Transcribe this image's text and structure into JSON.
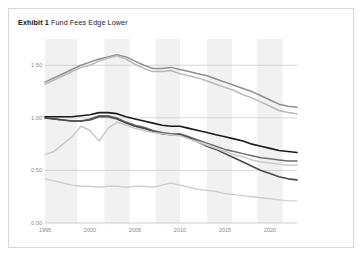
{
  "header": {
    "exhibit_label": "Exhibit 1",
    "title": "Fund Fees Edge Lower"
  },
  "legend": {
    "items": [
      {
        "label": "All (Asset Wt)",
        "color": "#4a4a4a",
        "badge": "①"
      },
      {
        "label": "All (Equal Wt)",
        "color": "#b9b9b9",
        "badge": ""
      },
      {
        "label": "Active (Asset Wt)",
        "color": "#1a1a1a",
        "badge": "②"
      },
      {
        "label": "Passive (Asset Wt)",
        "color": "#c9c9c9",
        "badge": "③"
      },
      {
        "label": "Active (Equal Wt)",
        "color": "#8f8f8f",
        "badge": ""
      },
      {
        "label": "Passive (Equal Wt)",
        "color": "#6f6f6f",
        "badge": ""
      }
    ]
  },
  "callouts": [
    {
      "badge": "②",
      "series": "Active (Asset Wt)"
    },
    {
      "badge": "①",
      "series": "All (Asset Wt)"
    },
    {
      "badge": "③",
      "series": "Passive (Asset Wt)"
    }
  ],
  "chart_data": {
    "type": "line",
    "title": "Fund Fees Edge Lower",
    "xlabel": "",
    "ylabel": "Average Fund Fee",
    "yunit": "%",
    "ylim": [
      0.0,
      1.75
    ],
    "xlim": [
      1995,
      2023
    ],
    "yticks": [
      0.0,
      0.5,
      1.0,
      1.5
    ],
    "ytick_labels": [
      "0.00",
      "0.50",
      "1.00",
      "1.50"
    ],
    "xticks": [
      1995,
      2000,
      2005,
      2010,
      2015,
      2020
    ],
    "xtick_labels": [
      "1995",
      "2000",
      "2005",
      "2010",
      "2015",
      "2020"
    ],
    "grid": "horizontal",
    "legend_position": "right",
    "shaded_bands": [
      {
        "from": 1995.0,
        "to": 1998.6
      },
      {
        "from": 2001.6,
        "to": 2004.4
      },
      {
        "from": 2007.3,
        "to": 2010.0
      },
      {
        "from": 2013.0,
        "to": 2015.8
      },
      {
        "from": 2018.6,
        "to": 2021.4
      }
    ],
    "x": [
      1995,
      1996,
      1997,
      1998,
      1999,
      2000,
      2001,
      2002,
      2003,
      2004,
      2005,
      2006,
      2007,
      2008,
      2009,
      2010,
      2011,
      2012,
      2013,
      2014,
      2015,
      2016,
      2017,
      2018,
      2019,
      2020,
      2021,
      2022,
      2023
    ],
    "series": [
      {
        "name": "Active (Equal Wt)",
        "color": "#8f8f8f",
        "width": 1.5,
        "values": [
          1.34,
          1.38,
          1.42,
          1.46,
          1.5,
          1.53,
          1.56,
          1.58,
          1.6,
          1.58,
          1.54,
          1.5,
          1.47,
          1.47,
          1.48,
          1.46,
          1.44,
          1.42,
          1.4,
          1.37,
          1.34,
          1.31,
          1.28,
          1.25,
          1.21,
          1.17,
          1.13,
          1.11,
          1.1
        ]
      },
      {
        "name": "All (Equal Wt)",
        "color": "#b9b9b9",
        "width": 1.5,
        "values": [
          1.32,
          1.36,
          1.4,
          1.44,
          1.48,
          1.5,
          1.54,
          1.57,
          1.59,
          1.56,
          1.51,
          1.47,
          1.44,
          1.44,
          1.45,
          1.42,
          1.4,
          1.38,
          1.35,
          1.32,
          1.29,
          1.26,
          1.22,
          1.19,
          1.15,
          1.11,
          1.07,
          1.05,
          1.04
        ]
      },
      {
        "name": "Active (Asset Wt)",
        "color": "#1a1a1a",
        "width": 1.6,
        "values": [
          1.01,
          1.01,
          1.01,
          1.01,
          1.02,
          1.03,
          1.05,
          1.05,
          1.04,
          1.01,
          0.99,
          0.97,
          0.95,
          0.93,
          0.92,
          0.92,
          0.9,
          0.88,
          0.86,
          0.84,
          0.82,
          0.8,
          0.78,
          0.75,
          0.73,
          0.71,
          0.69,
          0.68,
          0.67
        ]
      },
      {
        "name": "Passive (Equal Wt)",
        "color": "#6f6f6f",
        "width": 1.5,
        "values": [
          1.0,
          0.99,
          0.98,
          0.97,
          0.97,
          0.99,
          1.02,
          1.02,
          1.0,
          0.96,
          0.93,
          0.91,
          0.88,
          0.86,
          0.85,
          0.85,
          0.82,
          0.79,
          0.76,
          0.73,
          0.7,
          0.68,
          0.66,
          0.64,
          0.62,
          0.61,
          0.6,
          0.59,
          0.59
        ]
      },
      {
        "name": "All (Asset Wt)",
        "color": "#4a4a4a",
        "width": 1.6,
        "values": [
          1.0,
          0.99,
          0.98,
          0.97,
          0.97,
          0.98,
          1.01,
          1.01,
          0.99,
          0.95,
          0.92,
          0.9,
          0.87,
          0.85,
          0.84,
          0.84,
          0.81,
          0.77,
          0.73,
          0.7,
          0.66,
          0.62,
          0.58,
          0.54,
          0.5,
          0.47,
          0.44,
          0.42,
          0.41
        ]
      },
      {
        "name": "Passive (Asset Wt)",
        "color": "#c9c9c9",
        "width": 1.5,
        "values": [
          0.65,
          0.68,
          0.75,
          0.82,
          0.92,
          0.88,
          0.78,
          0.9,
          0.96,
          0.93,
          0.9,
          0.88,
          0.86,
          0.85,
          0.84,
          0.83,
          0.8,
          0.77,
          0.74,
          0.71,
          0.68,
          0.65,
          0.63,
          0.6,
          0.58,
          0.57,
          0.56,
          0.55,
          0.55
        ]
      },
      {
        "name": "Passive (Asset Wt) low",
        "color": "#cfcfcf",
        "width": 1.4,
        "values": [
          0.42,
          0.4,
          0.38,
          0.36,
          0.35,
          0.35,
          0.34,
          0.35,
          0.35,
          0.34,
          0.35,
          0.35,
          0.34,
          0.36,
          0.38,
          0.36,
          0.34,
          0.32,
          0.31,
          0.3,
          0.28,
          0.27,
          0.26,
          0.25,
          0.24,
          0.23,
          0.22,
          0.21,
          0.21
        ]
      }
    ]
  }
}
